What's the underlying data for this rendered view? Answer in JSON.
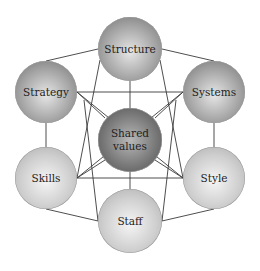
{
  "diagram": {
    "nodes": [
      {
        "id": "structure",
        "label": "Structure",
        "cx": 130,
        "cy": 49,
        "r": 32,
        "tone": "dark"
      },
      {
        "id": "strategy",
        "label": "Strategy",
        "cx": 46,
        "cy": 92,
        "r": 31,
        "tone": "dark"
      },
      {
        "id": "systems",
        "label": "Systems",
        "cx": 214,
        "cy": 92,
        "r": 31,
        "tone": "dark"
      },
      {
        "id": "shared-values",
        "label": "Shared\nvalues",
        "cx": 130,
        "cy": 140,
        "r": 32,
        "tone": "center"
      },
      {
        "id": "skills",
        "label": "Skills",
        "cx": 46,
        "cy": 178,
        "r": 31,
        "tone": "light"
      },
      {
        "id": "style",
        "label": "Style",
        "cx": 214,
        "cy": 178,
        "r": 31,
        "tone": "light"
      },
      {
        "id": "staff",
        "label": "Staff",
        "cx": 130,
        "cy": 221,
        "r": 32,
        "tone": "light"
      }
    ],
    "edges": [
      [
        "structure",
        "strategy"
      ],
      [
        "structure",
        "systems"
      ],
      [
        "structure",
        "shared-values"
      ],
      [
        "structure",
        "skills"
      ],
      [
        "structure",
        "style"
      ],
      [
        "strategy",
        "systems"
      ],
      [
        "strategy",
        "skills"
      ],
      [
        "strategy",
        "shared-values"
      ],
      [
        "strategy",
        "staff"
      ],
      [
        "strategy",
        "style"
      ],
      [
        "systems",
        "style"
      ],
      [
        "systems",
        "shared-values"
      ],
      [
        "systems",
        "staff"
      ],
      [
        "systems",
        "skills"
      ],
      [
        "skills",
        "style"
      ],
      [
        "skills",
        "staff"
      ],
      [
        "skills",
        "shared-values"
      ],
      [
        "style",
        "staff"
      ],
      [
        "style",
        "shared-values"
      ],
      [
        "staff",
        "shared-values"
      ]
    ],
    "line_color": "#3a3a3a"
  }
}
